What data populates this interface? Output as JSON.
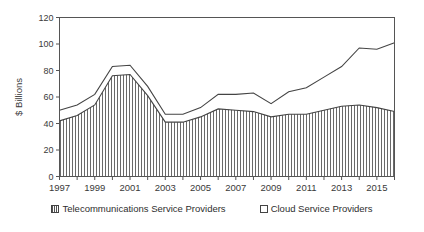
{
  "chart_data": {
    "type": "area",
    "stacked": true,
    "title": "",
    "xlabel": "",
    "ylabel": "$ Billions",
    "ylim": [
      0,
      120
    ],
    "ytick_step": 20,
    "yticks": [
      0,
      20,
      40,
      60,
      80,
      100,
      120
    ],
    "grid": false,
    "legend_position": "bottom",
    "x": [
      1997,
      1998,
      1999,
      2000,
      2001,
      2002,
      2003,
      2004,
      2005,
      2006,
      2007,
      2008,
      2009,
      2010,
      2011,
      2012,
      2013,
      2014,
      2015,
      2016
    ],
    "xtick_labels": [
      "1997",
      "1999",
      "2001",
      "2003",
      "2005",
      "2007",
      "2009",
      "2011",
      "2013",
      "2015"
    ],
    "xticks_labeled": [
      1997,
      1999,
      2001,
      2003,
      2005,
      2007,
      2009,
      2011,
      2013,
      2015
    ],
    "series": [
      {
        "name": "Telecommunications Service Providers",
        "fill": "vertical-hatch",
        "values": [
          42,
          46,
          54,
          76,
          77,
          61,
          41,
          41,
          45,
          51,
          50,
          49,
          45,
          47,
          47,
          50,
          53,
          54,
          52,
          49
        ]
      },
      {
        "name": "Cloud Service Providers",
        "fill": "white",
        "values": [
          8,
          8,
          8,
          7,
          7,
          7,
          6,
          6,
          7,
          11,
          12,
          14,
          10,
          17,
          20,
          25,
          30,
          43,
          44,
          52
        ]
      }
    ],
    "totals": [
      50,
      54,
      62,
      83,
      84,
      68,
      47,
      47,
      52,
      62,
      62,
      63,
      55,
      64,
      67,
      75,
      83,
      97,
      96,
      101
    ],
    "colors": {
      "line": "#444444",
      "hatch": "#555555",
      "background": "#ffffff"
    }
  },
  "legend": {
    "items": [
      {
        "label": "Telecommunications Service Providers",
        "marker": "hatched-square-icon"
      },
      {
        "label": "Cloud Service Providers",
        "marker": "open-square-icon"
      }
    ]
  }
}
